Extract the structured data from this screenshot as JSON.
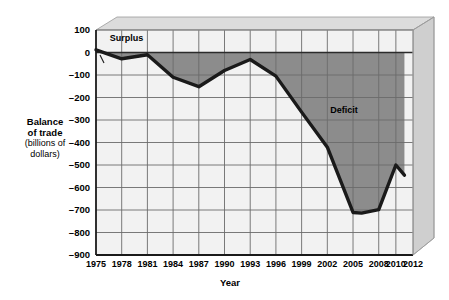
{
  "chart_data": {
    "type": "line",
    "title": "",
    "xlabel": "Year",
    "ylabel": "Balance of trade (billions of dollars)",
    "ylabel_line1": "Balance",
    "ylabel_line2": "of trade",
    "ylabel_line3": "(billions of",
    "ylabel_line4": "dollars)",
    "ylim": [
      -900,
      100
    ],
    "xlim": [
      1975,
      2012
    ],
    "grid": true,
    "legend": false,
    "yticks": [
      100,
      0,
      -100,
      -200,
      -300,
      -400,
      -500,
      -600,
      -700,
      -800,
      -900
    ],
    "ytick_labels": [
      "100",
      "0",
      "–100",
      "–200",
      "–300",
      "–400",
      "–500",
      "–600",
      "–700",
      "–800",
      "–900"
    ],
    "xticks": [
      1975,
      1978,
      1981,
      1984,
      1987,
      1990,
      1993,
      1996,
      1999,
      2002,
      2005,
      2008,
      2010,
      2012
    ],
    "xtick_labels": [
      "1975",
      "1978",
      "1981",
      "1984",
      "1987",
      "1990",
      "1993",
      "1996",
      "1999",
      "2002",
      "2005",
      "2008",
      "2010",
      "2012"
    ],
    "series": [
      {
        "name": "Balance of trade",
        "x": [
          1975,
          1978,
          1981,
          1984,
          1987,
          1990,
          1993,
          1996,
          1999,
          2002,
          2005,
          2006,
          2008,
          2010,
          2011
        ],
        "values": [
          12,
          -28,
          -10,
          -110,
          -152,
          -80,
          -31,
          -105,
          -265,
          -421,
          -711,
          -714,
          -698,
          -500,
          -545
        ]
      }
    ],
    "annotations": [
      {
        "name": "surplus-label",
        "text": "Surplus",
        "x": 1976.6,
        "y": 60
      },
      {
        "name": "deficit-label",
        "text": "Deficit",
        "x": 2004.2,
        "y": -260
      }
    ],
    "colors": {
      "line": "#1a1a1a",
      "deficit_fill": "#8c8c8c",
      "plot_background": "#f2f2f2",
      "grid": "#6b6b6b",
      "axis": "#1a1a1a",
      "frame_top": "#d8d8d8",
      "frame_side": "#c4c4c4",
      "text": "#000000"
    }
  }
}
